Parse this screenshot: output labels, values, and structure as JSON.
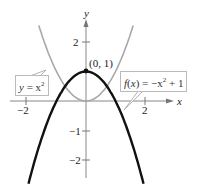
{
  "chart_data": {
    "type": "line",
    "title": "",
    "xlabel": "x",
    "ylabel": "y",
    "xlim": [
      -2.9,
      2.7
    ],
    "ylim": [
      -2.7,
      2.6
    ],
    "grid": false,
    "x_ticks": [
      "-2",
      "2"
    ],
    "y_ticks": [
      "2",
      "-1",
      "-2"
    ],
    "series": [
      {
        "name": "y = x^2",
        "function": "x^2",
        "color": "#a8a8a8"
      },
      {
        "name": "f(x) = -x^2 + 1",
        "function": "-x^2 + 1",
        "color": "#111111"
      }
    ],
    "annotations": [
      {
        "text": "(0, 1)",
        "x": 0,
        "y": 1,
        "marker": "point"
      },
      {
        "text": "y = x²",
        "target_series": "y = x^2"
      },
      {
        "text": "f(x) = −x² + 1",
        "target_series": "f(x) = -x^2 + 1"
      }
    ]
  },
  "labels": {
    "x_axis": "x",
    "y_axis": "y",
    "x_tick_neg2": "−2",
    "x_tick_2": "2",
    "y_tick_2": "2",
    "y_tick_neg1": "−1",
    "y_tick_neg2": "−2",
    "point": "(0, 1)",
    "callout_left_y": "y",
    "callout_left_eq": " = x",
    "callout_left_sup": "2",
    "callout_right_f": "f",
    "callout_right_mid": "(",
    "callout_right_x": "x",
    "callout_right_eq": ") = −x",
    "callout_right_sup": "2",
    "callout_right_tail": " + 1"
  }
}
